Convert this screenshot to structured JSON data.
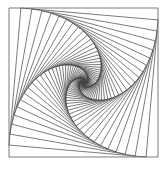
{
  "artwork": {
    "type": "nested-rotating-squares",
    "background": "#ffffff",
    "stroke_color": "#444444",
    "stroke_width": 0.7,
    "outer_square": {
      "x": 9,
      "y": 8,
      "size": 149
    },
    "step_fraction": 0.08,
    "iterations": 62
  }
}
